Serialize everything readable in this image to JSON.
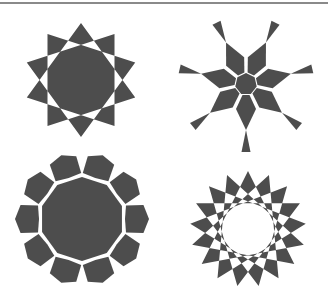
{
  "figure": {
    "fill_color": "#4d4d4d",
    "background": "#ffffff",
    "rule_color": "#8a8a8a"
  },
  "stars": [
    {
      "name": "ten-point-star",
      "type": "star-polygon",
      "points": 10,
      "step": 3,
      "center": [
        81,
        80
      ],
      "outer_radius": 57,
      "rotation_deg": -90,
      "center_filled": true
    },
    {
      "name": "seven-arm-star",
      "type": "bowtie-arms",
      "arms": 7,
      "center": [
        246,
        84
      ],
      "hub_radius": 11,
      "first_arm_deg": 90,
      "arm": {
        "r_base": 11,
        "w_base": 7,
        "r_wide": 25,
        "w_wide": 20,
        "r_pinch": 46,
        "r_tip": 68,
        "w_tip": 9
      }
    },
    {
      "name": "ten-petal-rosette",
      "type": "petal-rosette",
      "petals": 10,
      "center": [
        82,
        219
      ],
      "core_radius": 42,
      "petal_inner_radius": 46,
      "petal_outer_radius": 63,
      "petal_half_angle_deg": 17,
      "rotation_deg": -72
    },
    {
      "name": "seventeen-point-star",
      "type": "star-polygon",
      "points": 17,
      "step": 6,
      "center": [
        248,
        229
      ],
      "outer_radius": 58,
      "rotation_deg": -90,
      "center_filled": false
    }
  ]
}
